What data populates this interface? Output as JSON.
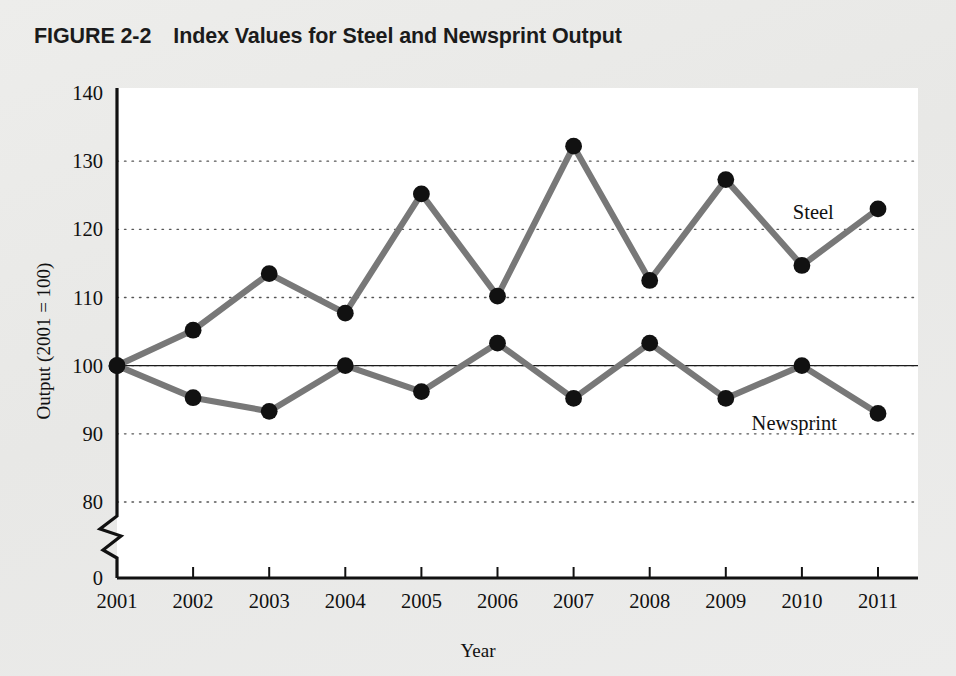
{
  "figure": {
    "number": "FIGURE 2-2",
    "title": "Index Values for Steel and Newsprint Output"
  },
  "colors": {
    "page_background": "#eaeae8",
    "plot_background": "#ffffff",
    "line": "#787878",
    "marker": "#111111",
    "axis": "#111111",
    "gridline": "#555555"
  },
  "chart_data": {
    "type": "line",
    "title": "Index Values for Steel and Newsprint Output",
    "xlabel": "Year",
    "ylabel": "Output (2001 = 100)",
    "x": [
      2001,
      2002,
      2003,
      2004,
      2005,
      2006,
      2007,
      2008,
      2009,
      2010,
      2011
    ],
    "categories": [
      "2001",
      "2002",
      "2003",
      "2004",
      "2005",
      "2006",
      "2007",
      "2008",
      "2009",
      "2010",
      "2011"
    ],
    "series": [
      {
        "name": "Steel",
        "values": [
          100,
          105.2,
          113.5,
          107.7,
          125.2,
          110.2,
          132.2,
          112.5,
          127.3,
          114.7,
          123.0
        ],
        "label_x": 2010.15,
        "label_y": 121.5
      },
      {
        "name": "Newsprint",
        "values": [
          100,
          95.3,
          93.3,
          100,
          96.2,
          103.3,
          95.2,
          103.3,
          95.2,
          100,
          93.0
        ],
        "label_x": 2009.9,
        "label_y": 90.6
      }
    ],
    "ylim": [
      80,
      140
    ],
    "yticks": [
      80,
      90,
      100,
      110,
      120,
      130,
      140
    ],
    "ytick_labels": [
      "80",
      "90",
      "100",
      "110",
      "120",
      "130",
      "140"
    ],
    "y_zero_label": "0",
    "axis_break": true,
    "grid": true,
    "grid_style": "dotted",
    "grid_axis": "y",
    "reference_line": 100,
    "legend": "inline-labels",
    "marker": "circle"
  }
}
